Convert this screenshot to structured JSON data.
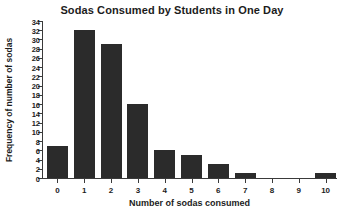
{
  "chart_data": {
    "type": "bar",
    "title": "Sodas Consumed by Students in One Day",
    "xlabel": "Number of sodas consumed",
    "ylabel": "Frequency of number of sodas",
    "categories": [
      "0",
      "1",
      "2",
      "3",
      "4",
      "5",
      "6",
      "7",
      "8",
      "9",
      "10"
    ],
    "values": [
      7,
      32,
      29,
      16,
      6,
      5,
      3,
      1,
      0,
      0,
      1
    ],
    "ylim": [
      0,
      34
    ],
    "ytick_step": 2,
    "yticks": [
      0,
      2,
      4,
      6,
      8,
      10,
      12,
      14,
      16,
      18,
      20,
      22,
      24,
      26,
      28,
      30,
      32,
      34
    ],
    "ytick_labels": [
      "0",
      "2",
      "4",
      "6",
      "8",
      "10",
      "12",
      "14",
      "16",
      "18",
      "20",
      "22",
      "24",
      "26",
      "28",
      "30",
      "32",
      "34"
    ],
    "grid": false,
    "legend": false,
    "bar_color": "#2b2b2b",
    "axis_color": "#3a3a3a",
    "background_color": "#ffffff"
  }
}
